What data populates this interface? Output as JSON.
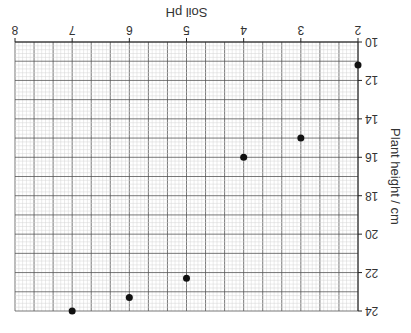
{
  "chart_data": {
    "type": "scatter",
    "title": "",
    "xlabel": "Soil pH",
    "ylabel": "Plant height / cm",
    "xlim": [
      2,
      8
    ],
    "ylim": [
      10,
      24
    ],
    "xticks": [
      2,
      3,
      4,
      5,
      6,
      7,
      8
    ],
    "yticks": [
      10,
      12,
      14,
      16,
      18,
      20,
      22,
      24
    ],
    "grid": true,
    "orientation_note": "image displayed rotated 180 degrees",
    "points": [
      {
        "x": 2,
        "y": 11.2
      },
      {
        "x": 3,
        "y": 15.0
      },
      {
        "x": 4,
        "y": 16.0
      },
      {
        "x": 5,
        "y": 22.3
      },
      {
        "x": 6,
        "y": 23.3
      },
      {
        "x": 7,
        "y": 24.0
      }
    ],
    "marker_color": "#111111"
  }
}
